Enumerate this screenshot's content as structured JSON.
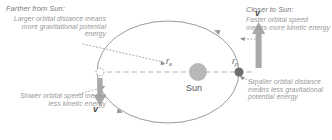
{
  "diagram": {
    "title_far": "Farther from Sun:",
    "body_far": "Larger orbital distance means more gravitational potential energy",
    "title_near": "Closer to Sun:",
    "body_near": "Faster orbital speed means more kinetic energy",
    "body_slow": "Slower orbital speed means less kinetic energy",
    "body_small_distance": "Smaller orbital distance means less gravitational potential energy",
    "sun_label": "Sun",
    "velocity_symbol_aphelion": "v",
    "velocity_symbol_perihelion": "v",
    "radius_aphelion_symbol": "r",
    "radius_aphelion_subscript": "a",
    "radius_perihelion_symbol": "r",
    "radius_perihelion_subscript": "p"
  },
  "colors": {
    "orbit_stroke": "#9b9b9b",
    "axis_dashed": "#b0a8a8",
    "leader_dotted": "#9a9a9a",
    "sun_fill": "#b8b8b8",
    "planet_perihelion_fill": "#6e6e6e",
    "planet_aphelion_fill": "#ffffff",
    "planet_aphelion_stroke": "#9a9a9a",
    "arrow_fill": "#a9a9a9",
    "text_heading": "#7a7a7a",
    "text_body": "#9a9a9a",
    "text_symbol": "#4a4a4a",
    "background": "#ffffff"
  },
  "geometry": {
    "ellipse_center_x": 168,
    "ellipse_center_y": 72,
    "ellipse_rx": 71,
    "ellipse_ry": 51,
    "sun_x": 198,
    "sun_y": 72,
    "sun_r": 9,
    "planet_aphelion_x": 100,
    "planet_aphelion_y": 72,
    "planet_aphelion_r": 4,
    "planet_perihelion_x": 239,
    "planet_perihelion_y": 72,
    "planet_perihelion_r": 4.5,
    "orbit_direction": "counterclockwise"
  }
}
